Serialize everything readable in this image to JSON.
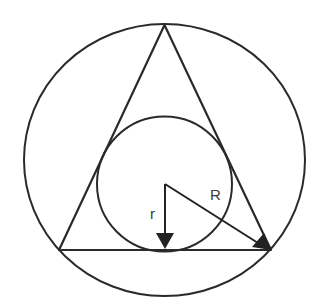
{
  "diagram": {
    "type": "geometry",
    "colors": {
      "stroke": "#222222",
      "background": "#ffffff",
      "label": "#3a3a3a"
    },
    "labels": {
      "inradius": "r",
      "circumradius": "R"
    }
  }
}
